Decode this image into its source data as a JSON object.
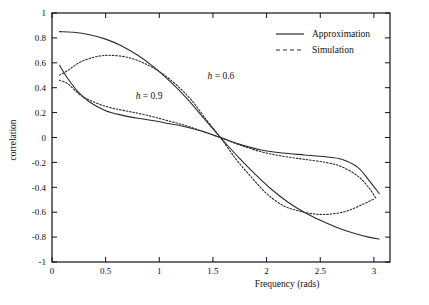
{
  "chart_data": {
    "type": "line",
    "title": "",
    "xlabel": "Frequency (rads)",
    "ylabel": "correlation",
    "xlim": [
      0,
      3.15
    ],
    "ylim": [
      -1,
      1
    ],
    "xticks": [
      "0",
      "0.5",
      "1",
      "1.5",
      "2",
      "2.5",
      "3"
    ],
    "xtick_values": [
      0,
      0.5,
      1,
      1.5,
      2,
      2.5,
      3
    ],
    "yticks": [
      "1",
      "0.8",
      "0.6",
      "0.4",
      "0.2",
      "0",
      "-0.2",
      "-0.4",
      "-0.6",
      "-0.8",
      "-1"
    ],
    "ytick_values": [
      1,
      0.8,
      0.6,
      0.4,
      0.2,
      0,
      -0.2,
      -0.4,
      -0.6,
      -0.8,
      -1
    ],
    "grid": false,
    "legend_position": "top-right",
    "legend": [
      {
        "label": "Approximation",
        "style": "solid"
      },
      {
        "label": "Simulation",
        "style": "dashed"
      }
    ],
    "annotations": [
      {
        "text_italic": "h",
        "text": " = 0.6",
        "x": 1.45,
        "y": 0.47
      },
      {
        "text_italic": "h",
        "text": " = 0.9",
        "x": 0.78,
        "y": 0.31
      }
    ],
    "series": [
      {
        "name": "h = 0.6 Approximation",
        "style": "solid",
        "x": [
          0.07,
          0.2,
          0.35,
          0.5,
          0.65,
          0.8,
          0.95,
          1.1,
          1.25,
          1.4,
          1.57,
          1.75,
          1.9,
          2.05,
          2.2,
          2.35,
          2.5,
          2.65,
          2.8,
          2.95,
          3.05
        ],
        "y": [
          0.85,
          0.845,
          0.825,
          0.79,
          0.735,
          0.66,
          0.565,
          0.45,
          0.32,
          0.17,
          0.0,
          -0.17,
          -0.3,
          -0.42,
          -0.52,
          -0.6,
          -0.665,
          -0.72,
          -0.765,
          -0.8,
          -0.815
        ]
      },
      {
        "name": "h = 0.6 Simulation",
        "style": "dashed",
        "x": [
          0.07,
          0.15,
          0.25,
          0.35,
          0.45,
          0.55,
          0.7,
          0.85,
          1.0,
          1.15,
          1.3,
          1.45,
          1.57,
          1.72,
          1.87,
          2.0,
          2.15,
          2.3,
          2.45,
          2.6,
          2.75,
          2.9,
          3.0
        ],
        "y": [
          0.5,
          0.54,
          0.6,
          0.635,
          0.655,
          0.66,
          0.645,
          0.6,
          0.53,
          0.43,
          0.3,
          0.13,
          0.0,
          -0.18,
          -0.33,
          -0.45,
          -0.545,
          -0.59,
          -0.615,
          -0.615,
          -0.59,
          -0.535,
          -0.495
        ]
      },
      {
        "name": "h = 0.9 Approximation",
        "style": "solid",
        "x": [
          0.07,
          0.15,
          0.25,
          0.35,
          0.5,
          0.65,
          0.8,
          0.95,
          1.1,
          1.25,
          1.4,
          1.57,
          1.75,
          1.95,
          2.15,
          2.35,
          2.55,
          2.7,
          2.85,
          2.95,
          3.05
        ],
        "y": [
          0.58,
          0.47,
          0.36,
          0.285,
          0.215,
          0.18,
          0.155,
          0.135,
          0.11,
          0.085,
          0.05,
          0.0,
          -0.055,
          -0.1,
          -0.125,
          -0.14,
          -0.155,
          -0.175,
          -0.24,
          -0.34,
          -0.45
        ]
      },
      {
        "name": "h = 0.9 Simulation",
        "style": "dashed",
        "x": [
          0.07,
          0.15,
          0.25,
          0.35,
          0.5,
          0.65,
          0.8,
          0.95,
          1.1,
          1.25,
          1.4,
          1.57,
          1.75,
          1.95,
          2.15,
          2.35,
          2.55,
          2.7,
          2.85,
          2.95,
          3.02
        ],
        "y": [
          0.46,
          0.43,
          0.35,
          0.3,
          0.25,
          0.22,
          0.195,
          0.165,
          0.13,
          0.095,
          0.05,
          0.0,
          -0.06,
          -0.115,
          -0.15,
          -0.175,
          -0.2,
          -0.235,
          -0.31,
          -0.4,
          -0.49
        ]
      }
    ]
  },
  "axes": {
    "ylabel": "correlation",
    "xlabel": "Frequency (rads)"
  },
  "colors": {
    "ink": "#111111",
    "curve": "#2b2b2b",
    "background": "#ffffff"
  }
}
